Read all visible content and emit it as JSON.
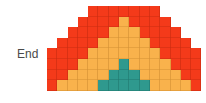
{
  "label": "End",
  "colors": {
    "R": "#f43a1a",
    "O": "#f9b24c",
    "T": "#2f998e"
  },
  "grid": {
    "columns": 15,
    "rows": [
      "....RRRRRRR....",
      "...RRRRORRRR...",
      "..RRRROOORRRR..",
      ".RRRROOOOORRRR.",
      "RRRROOOOOOORRRR",
      "RRROOOOTOOOORRR",
      "RROOOOTTTOOOORR",
      "ROOOOTTTTTOOOOR"
    ]
  }
}
